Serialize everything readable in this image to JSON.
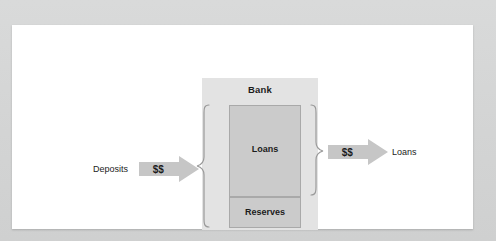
{
  "diagram": {
    "bank": {
      "label": "Bank",
      "components": [
        {
          "name": "loans",
          "label": "Loans"
        },
        {
          "name": "reserves",
          "label": "Reserves"
        }
      ]
    },
    "inflow": {
      "source_label": "Deposits",
      "arrow_label": "$$"
    },
    "outflow": {
      "target_label": "Loans",
      "arrow_label": "$$"
    },
    "braces": [
      {
        "name": "left-brace",
        "direction": "left",
        "spans": "Loans and Reserves"
      },
      {
        "name": "right-brace",
        "direction": "right",
        "spans": "Loans"
      }
    ]
  },
  "colors": {
    "page_background": "#d6d7d7",
    "card_background": "#ffffff",
    "bank_panel": "#e3e3e3",
    "component_box": "#cbcbcb",
    "component_border": "#a9a9a9",
    "arrow_fill": "#c6c6c6",
    "text": "#1c1c1c"
  }
}
